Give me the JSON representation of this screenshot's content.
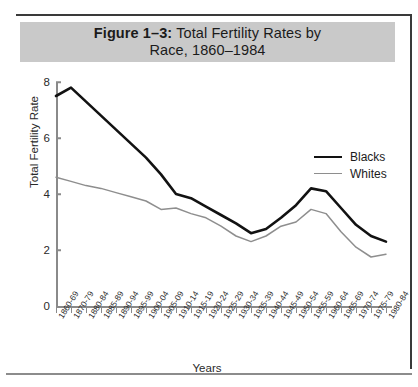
{
  "figure": {
    "label": "Figure 1–3:",
    "title": "Total Fertility Rates by",
    "title_line2": "Race, 1860–1984",
    "banner_color": "#c9c9c9"
  },
  "legend": {
    "position": "top-right",
    "entries": [
      {
        "label": "Blacks",
        "color": "#121212",
        "width": "thick"
      },
      {
        "label": "Whites",
        "color": "#8e8e8e",
        "width": "thin"
      }
    ]
  },
  "axes": {
    "y_label": "Total Fertility Rate",
    "x_label": "Years",
    "y_ticks": [
      "0",
      "2",
      "4",
      "6",
      "8"
    ],
    "ylim": [
      0,
      8
    ],
    "grid": false
  },
  "chart_data": {
    "type": "line",
    "title": "Figure 1–3: Total Fertility Rates by Race, 1860–1984",
    "xlabel": "Years",
    "ylabel": "Total Fertility Rate",
    "ylim": [
      0,
      8
    ],
    "yticks": [
      0,
      2,
      4,
      6,
      8
    ],
    "grid": false,
    "legend_position": "top-right",
    "categories": [
      "1860-69",
      "1870-79",
      "1880-84",
      "1885-89",
      "1890-94",
      "1895-99",
      "1900-04",
      "1905-09",
      "1910-14",
      "1915-19",
      "1920-24",
      "1925-29",
      "1930-34",
      "1935-39",
      "1940-44",
      "1945-49",
      "1950-54",
      "1955-59",
      "1960-64",
      "1965-69",
      "1970-74",
      "1975-79",
      "1980-84"
    ],
    "series": [
      {
        "name": "Blacks",
        "color": "#121212",
        "values": [
          7.5,
          7.8,
          7.3,
          6.8,
          6.3,
          5.8,
          5.3,
          4.7,
          4.0,
          3.85,
          3.55,
          3.25,
          2.95,
          2.6,
          2.75,
          3.15,
          3.6,
          4.2,
          4.1,
          3.5,
          2.9,
          2.5,
          2.3
        ]
      },
      {
        "name": "Whites",
        "color": "#8e8e8e",
        "values": [
          4.6,
          4.45,
          4.3,
          4.2,
          4.05,
          3.9,
          3.75,
          3.45,
          3.5,
          3.3,
          3.15,
          2.85,
          2.5,
          2.3,
          2.5,
          2.85,
          3.0,
          3.45,
          3.3,
          2.65,
          2.1,
          1.75,
          1.85
        ]
      }
    ]
  }
}
